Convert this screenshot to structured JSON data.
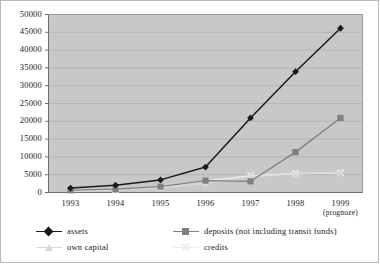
{
  "chart_data": {
    "type": "line",
    "title": "",
    "subtitle": "",
    "xlabel": "",
    "ylabel": "",
    "categories": [
      "1993",
      "1994",
      "1995",
      "1996",
      "1997",
      "1998",
      "1999"
    ],
    "category_sublabels": [
      "",
      "",
      "",
      "",
      "",
      "",
      "(prognoze)"
    ],
    "ylim": [
      0,
      50000
    ],
    "yticks": [
      0,
      5000,
      10000,
      15000,
      20000,
      25000,
      30000,
      35000,
      40000,
      45000,
      50000
    ],
    "ytick_labels": [
      "0",
      "5000",
      "10000",
      "15000",
      "20000",
      "25000",
      "30000",
      "35000",
      "40000",
      "45000",
      "50000"
    ],
    "grid": true,
    "grid_axis": "y",
    "legend_position": "bottom",
    "plot_background": "#c8c8c8",
    "series": [
      {
        "name": "assets",
        "color": "#1a1a1a",
        "marker": "diamond",
        "values": [
          1100,
          1900,
          3400,
          7000,
          20800,
          33800,
          46000
        ]
      },
      {
        "name": "deposits (not including transit funds)",
        "color": "#808080",
        "marker": "square",
        "values": [
          500,
          800,
          1500,
          3200,
          3000,
          11200,
          20800
        ]
      },
      {
        "name": "own capital",
        "color": "#d9d9d9",
        "marker": "triangle",
        "values": [
          400,
          600,
          1100,
          2400,
          4300,
          5000,
          5600
        ]
      },
      {
        "name": "credits",
        "color": "#ededed",
        "marker": "x",
        "values": [
          350,
          550,
          1300,
          3100,
          4600,
          5200,
          5400
        ]
      }
    ]
  },
  "legend": {
    "entries": [
      {
        "label": "assets",
        "key": "diamond-marker-icon"
      },
      {
        "label": "deposits (not including transit funds)",
        "key": "square-marker-icon"
      },
      {
        "label": "own capital",
        "key": "triangle-marker-icon"
      },
      {
        "label": "credits",
        "key": "x-marker-icon"
      }
    ]
  }
}
